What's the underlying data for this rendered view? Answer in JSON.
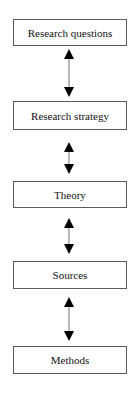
{
  "diagram": {
    "type": "vertical-flow",
    "nodes": [
      {
        "id": "research-questions",
        "label": "Research questions",
        "top": 19,
        "height": 27
      },
      {
        "id": "research-strategy",
        "label": "Research strategy",
        "top": 101,
        "height": 29
      },
      {
        "id": "theory",
        "label": "Theory",
        "top": 181,
        "height": 27
      },
      {
        "id": "sources",
        "label": "Sources",
        "top": 261,
        "height": 28
      },
      {
        "id": "methods",
        "label": "Methods",
        "top": 346,
        "height": 28
      }
    ],
    "edges": [
      {
        "from": "research-questions",
        "to": "research-strategy",
        "direction": "bidirectional"
      },
      {
        "from": "research-strategy",
        "to": "theory",
        "direction": "bidirectional"
      },
      {
        "from": "theory",
        "to": "sources",
        "direction": "bidirectional"
      },
      {
        "from": "sources",
        "to": "methods",
        "direction": "bidirectional"
      }
    ],
    "colors": {
      "border": "#5a5a5a",
      "arrow_head": "#000000",
      "arrow_shaft": "#888888",
      "text": "#111111"
    }
  }
}
